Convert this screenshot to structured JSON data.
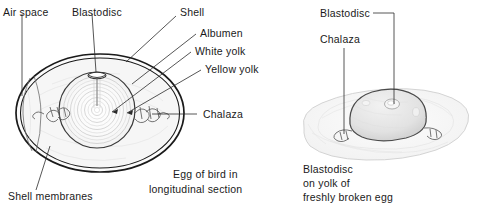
{
  "figure": {
    "title_hidden": "",
    "left_diagram": {
      "name": "egg-longitudinal-section",
      "caption_lines": [
        "Egg of bird in",
        "longitudinal section"
      ],
      "labels": [
        {
          "id": "air-space",
          "text": "Air space"
        },
        {
          "id": "blastodisc",
          "text": "Blastodisc"
        },
        {
          "id": "shell",
          "text": "Shell"
        },
        {
          "id": "albumen",
          "text": "Albumen"
        },
        {
          "id": "white-yolk",
          "text": "White yolk"
        },
        {
          "id": "yellow-yolk",
          "text": "Yellow yolk"
        },
        {
          "id": "chalaza",
          "text": "Chalaza"
        },
        {
          "id": "shell-membranes",
          "text": "Shell membranes"
        }
      ]
    },
    "right_diagram": {
      "name": "freshly-broken-egg",
      "caption_lines": [
        "Blastodisc",
        "on yolk of",
        "freshly broken egg"
      ],
      "labels": [
        {
          "id": "blastodisc",
          "text": "Blastodisc"
        },
        {
          "id": "chalaza",
          "text": "Chalaza"
        }
      ]
    },
    "colors": {
      "ink": "#1a1a1a",
      "line": "#2b2b2b",
      "background": "#ffffff",
      "shading": "#f0f0f0"
    }
  }
}
